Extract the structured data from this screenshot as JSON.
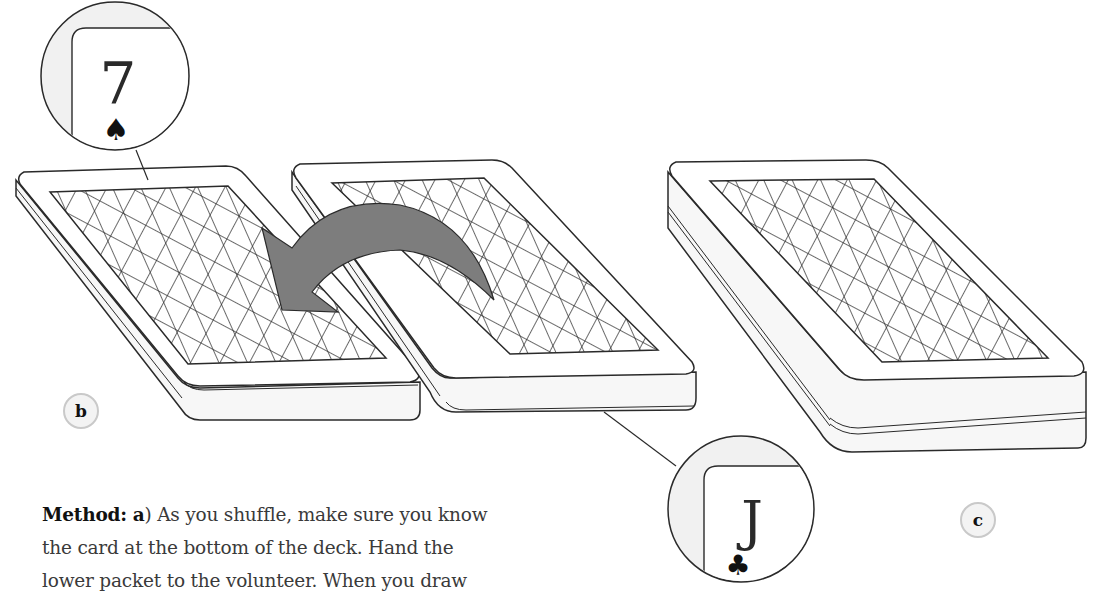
{
  "figure": {
    "callouts": [
      {
        "id": "top-card",
        "rank": "7",
        "suit": "spade",
        "suit_glyph": "♠"
      },
      {
        "id": "bottom-card",
        "rank": "J",
        "suit": "club",
        "suit_glyph": "♣"
      }
    ],
    "step_labels": [
      {
        "id": "b",
        "text": "b"
      },
      {
        "id": "c",
        "text": "c"
      }
    ],
    "arrow": {
      "color": "#7d7d7d",
      "direction": "right-to-left"
    },
    "colors": {
      "line": "#2a2a2a",
      "card_face": "#ffffff",
      "shading": "#efefef",
      "label_bg": "#f3f3f3",
      "label_border": "#c9c9c9"
    }
  },
  "text": {
    "heading": "Method:",
    "step_marker": "a",
    "line1_rest": ") As you shuffle, make sure you know",
    "line2": "the card at the bottom of the deck. Hand the",
    "line3": "lower packet to the volunteer. When you draw"
  }
}
